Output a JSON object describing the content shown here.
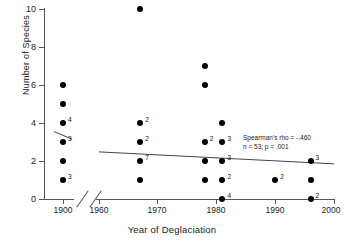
{
  "chart_data": {
    "type": "scatter",
    "title": "",
    "xlabel": "Year of Deglaciation",
    "ylabel": "Number of Species",
    "xlim": [
      1960,
      2000
    ],
    "ylim": [
      0,
      10
    ],
    "xticks": [
      "1900",
      "1960",
      "1970",
      "1980",
      "1990",
      "2000"
    ],
    "yticks": [
      "0",
      "2",
      "4",
      "6",
      "8",
      "10"
    ],
    "grid": false,
    "legend": false,
    "axis_break": {
      "present": true,
      "between": [
        "1900",
        "1960"
      ],
      "style": "double-slash"
    },
    "points": [
      {
        "x": 1900,
        "y": 6,
        "count": ""
      },
      {
        "x": 1900,
        "y": 5,
        "count": ""
      },
      {
        "x": 1900,
        "y": 4,
        "count": "4"
      },
      {
        "x": 1900,
        "y": 3,
        "count": "3"
      },
      {
        "x": 1900,
        "y": 2,
        "count": ""
      },
      {
        "x": 1900,
        "y": 1,
        "count": "3"
      },
      {
        "x": 1967,
        "y": 10,
        "count": ""
      },
      {
        "x": 1967,
        "y": 4,
        "count": "2"
      },
      {
        "x": 1967,
        "y": 3,
        "count": "2"
      },
      {
        "x": 1967,
        "y": 2,
        "count": "7"
      },
      {
        "x": 1967,
        "y": 1,
        "count": ""
      },
      {
        "x": 1978,
        "y": 7,
        "count": ""
      },
      {
        "x": 1978,
        "y": 6,
        "count": ""
      },
      {
        "x": 1978,
        "y": 3,
        "count": "2"
      },
      {
        "x": 1978,
        "y": 2,
        "count": ""
      },
      {
        "x": 1978,
        "y": 1,
        "count": ""
      },
      {
        "x": 1981,
        "y": 4,
        "count": ""
      },
      {
        "x": 1981,
        "y": 3,
        "count": "3"
      },
      {
        "x": 1981,
        "y": 2,
        "count": "3"
      },
      {
        "x": 1981,
        "y": 1,
        "count": "2"
      },
      {
        "x": 1981,
        "y": 0,
        "count": "4"
      },
      {
        "x": 1990,
        "y": 1,
        "count": "2"
      },
      {
        "x": 1996,
        "y": 2,
        "count": "3"
      },
      {
        "x": 1996,
        "y": 1,
        "count": ""
      },
      {
        "x": 1996,
        "y": 0,
        "count": "2"
      }
    ],
    "trend_lines": [
      {
        "panel": "left",
        "x1": 1896.5,
        "y1": 3.55,
        "x2": 1903.5,
        "y2": 3.15
      },
      {
        "panel": "main",
        "x1": 1960.0,
        "y1": 2.48,
        "x2": 2000.0,
        "y2": 1.85
      }
    ],
    "annotation": {
      "line1": "Spearman's rho = -.460",
      "line2": "n = 53; p = .001"
    },
    "colors": {
      "point": "#000000",
      "axis": "#555555",
      "trend": "#444444",
      "text": "#1a1a1a",
      "background": "#ffffff"
    }
  }
}
